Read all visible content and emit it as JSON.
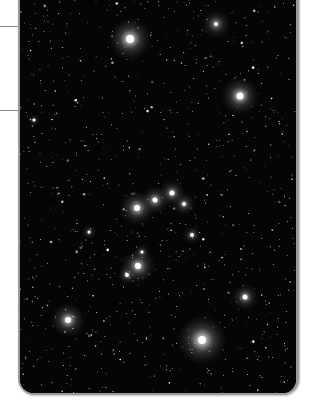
{
  "image": {
    "alt": "Deep-sky photograph of a galaxy cluster against a dense star field",
    "background": "#000000",
    "border_color": "#9a9a9a"
  },
  "rules": [
    {
      "y": 26
    },
    {
      "y": 110
    }
  ],
  "galaxies": [
    {
      "x": 128,
      "y": 39,
      "r": 22,
      "core": 4,
      "intensity": 0.95
    },
    {
      "x": 238,
      "y": 96,
      "r": 20,
      "core": 3.5,
      "intensity": 0.85
    },
    {
      "x": 214,
      "y": 24,
      "r": 16,
      "core": 2,
      "intensity": 0.55
    },
    {
      "x": 135,
      "y": 208,
      "r": 18,
      "core": 3,
      "intensity": 0.8
    },
    {
      "x": 153,
      "y": 200,
      "r": 15,
      "core": 2.5,
      "intensity": 0.7
    },
    {
      "x": 170,
      "y": 193,
      "r": 14,
      "core": 2.5,
      "intensity": 0.65
    },
    {
      "x": 182,
      "y": 204,
      "r": 12,
      "core": 2,
      "intensity": 0.55
    },
    {
      "x": 190,
      "y": 235,
      "r": 10,
      "core": 2,
      "intensity": 0.5
    },
    {
      "x": 136,
      "y": 266,
      "r": 18,
      "core": 3,
      "intensity": 0.8
    },
    {
      "x": 125,
      "y": 275,
      "r": 10,
      "core": 2,
      "intensity": 0.55
    },
    {
      "x": 140,
      "y": 252,
      "r": 8,
      "core": 1.5,
      "intensity": 0.5
    },
    {
      "x": 66,
      "y": 320,
      "r": 18,
      "core": 3,
      "intensity": 0.8
    },
    {
      "x": 243,
      "y": 297,
      "r": 14,
      "core": 2.5,
      "intensity": 0.65
    },
    {
      "x": 200,
      "y": 340,
      "r": 26,
      "core": 4,
      "intensity": 0.95
    },
    {
      "x": 32,
      "y": 120,
      "r": 6,
      "core": 1.5,
      "intensity": 0.5
    },
    {
      "x": 87,
      "y": 232,
      "r": 8,
      "core": 1.5,
      "intensity": 0.45
    }
  ],
  "star_field": {
    "seed": 7,
    "count": 900,
    "width": 276,
    "height": 395
  }
}
